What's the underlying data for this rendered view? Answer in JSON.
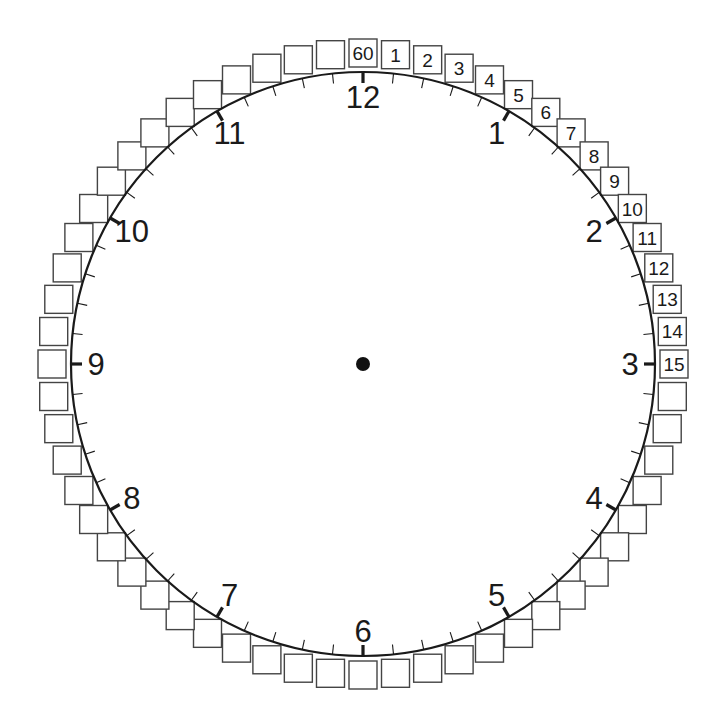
{
  "colors": {
    "background": "#ffffff",
    "ink": "#1a1a1a",
    "box_stroke": "#444444"
  },
  "clock": {
    "center": [
      363,
      364
    ],
    "radius": 292,
    "center_dot_radius": 7,
    "hour_labels": [
      "12",
      "1",
      "2",
      "3",
      "4",
      "5",
      "6",
      "7",
      "8",
      "9",
      "10",
      "11"
    ],
    "hour_label_radius": 267,
    "minute_tick_length": 10,
    "hour_tick_length": 11,
    "minute_boxes": {
      "count": 60,
      "box_size": 28,
      "center_radius": 311,
      "labels": {
        "0": "60",
        "1": "1",
        "2": "2",
        "3": "3",
        "4": "4",
        "5": "5",
        "6": "6",
        "7": "7",
        "8": "8",
        "9": "9",
        "10": "10",
        "11": "11",
        "12": "12",
        "13": "13",
        "14": "14",
        "15": "15"
      }
    }
  }
}
